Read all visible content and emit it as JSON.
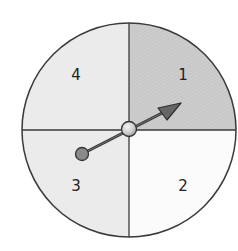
{
  "spinner": {
    "center": [
      129,
      130
    ],
    "radius": 107,
    "outline_color": "#3a3a3a",
    "sections": [
      {
        "label": "1",
        "position": "top-right",
        "fill": "#c9c9c9"
      },
      {
        "label": "2",
        "position": "bottom-right",
        "fill": "#fbfbfb"
      },
      {
        "label": "3",
        "position": "bottom-left",
        "fill": "#ebebeb"
      },
      {
        "label": "4",
        "position": "top-left",
        "fill": "#ebebeb"
      }
    ],
    "arrow": {
      "color": "#555555",
      "points_to": "1",
      "tail_color": "#8a8a8a",
      "hub_color": "#d8d8d8"
    }
  }
}
